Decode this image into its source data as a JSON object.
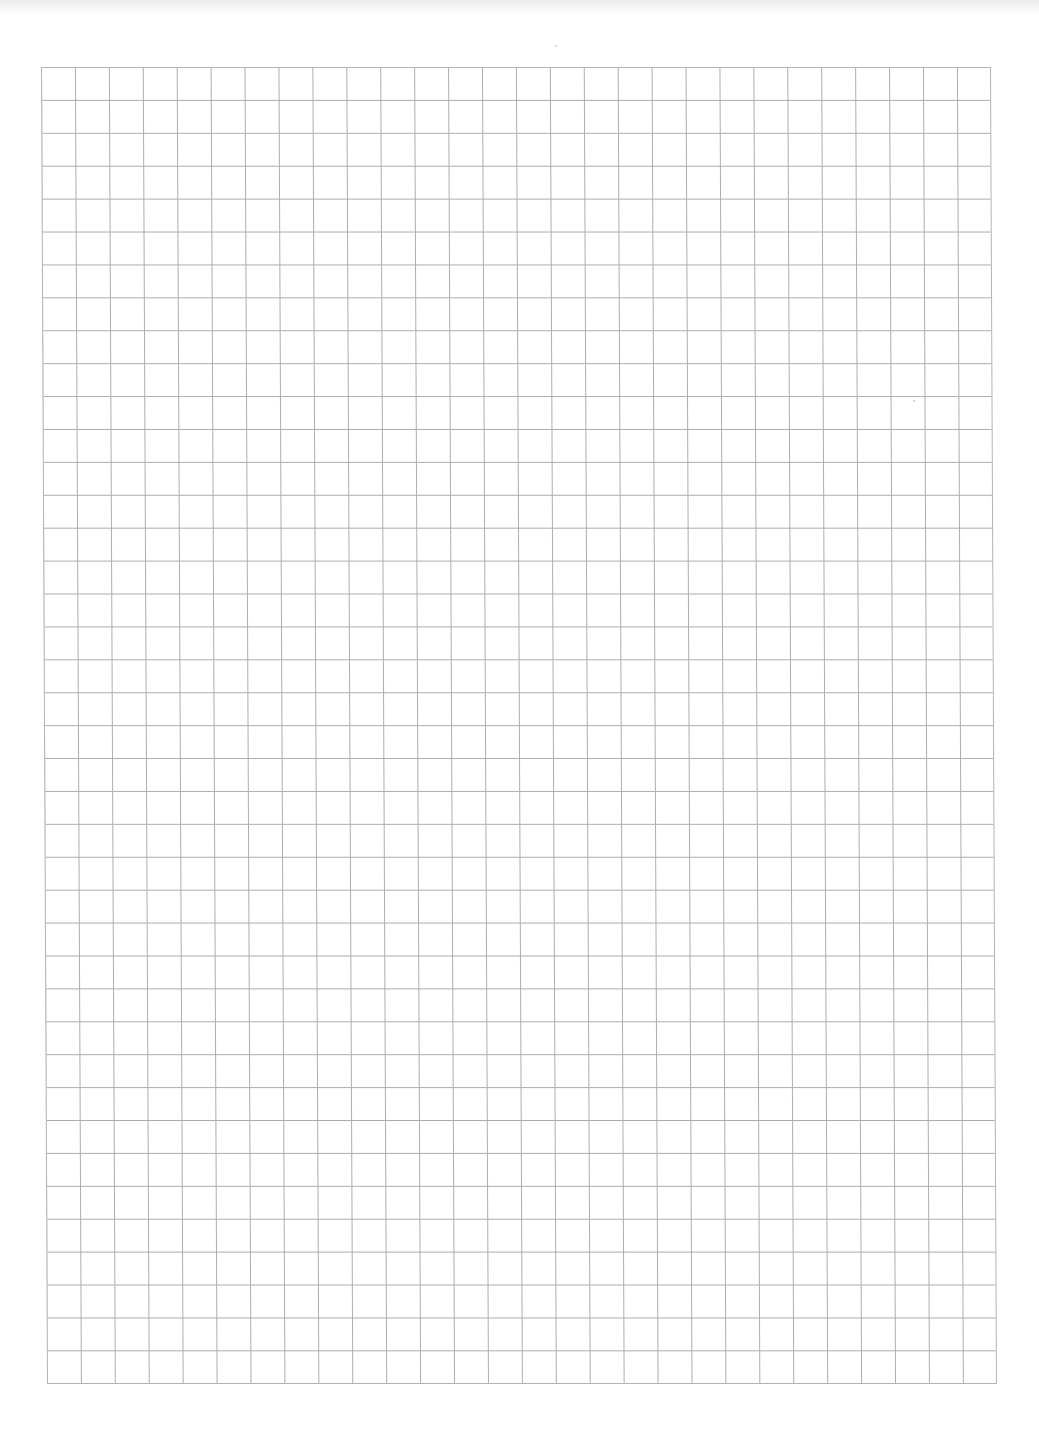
{
  "document": {
    "type": "grid-paper",
    "background_color": "#ffffff",
    "line_color": "#adadad",
    "border_color": "#b4b4b4",
    "grid": {
      "columns": 28,
      "rows": 40,
      "left": 41,
      "top": 67,
      "width": 950,
      "height": 1317,
      "cell_width": 33.93,
      "cell_height": 32.92
    },
    "text_content": ""
  }
}
